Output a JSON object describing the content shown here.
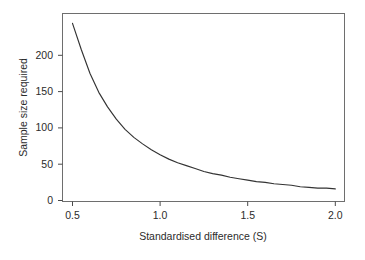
{
  "chart_data": {
    "type": "line",
    "title": "",
    "subtitle": "",
    "xlabel": "Standardised difference (S)",
    "ylabel": "Sample size required",
    "xlim": [
      0.43,
      2.07
    ],
    "ylim": [
      0,
      250
    ],
    "xticks": [
      0.5,
      1.0,
      1.5,
      2.0
    ],
    "xtick_labels": [
      "0.5",
      "1.0",
      "1.5",
      "2.0"
    ],
    "yticks": [
      0,
      50,
      100,
      150,
      200
    ],
    "ytick_labels": [
      "0",
      "50",
      "100",
      "150",
      "200"
    ],
    "grid": false,
    "legend": false,
    "legend_position": "none",
    "series": [
      {
        "name": "Sample size required",
        "relation": "n = 63 / S^2",
        "x": [
          0.5,
          0.55,
          0.6,
          0.65,
          0.7,
          0.75,
          0.8,
          0.85,
          0.9,
          0.95,
          1.0,
          1.05,
          1.1,
          1.15,
          1.2,
          1.25,
          1.3,
          1.35,
          1.4,
          1.45,
          1.5,
          1.55,
          1.6,
          1.65,
          1.7,
          1.75,
          1.8,
          1.85,
          1.9,
          1.95,
          2.0
        ],
        "values": [
          244,
          208,
          175,
          149,
          129,
          112,
          98,
          87,
          78,
          70,
          63,
          57,
          52,
          48,
          44,
          40,
          37,
          35,
          32,
          30,
          28,
          26,
          25,
          23,
          22,
          21,
          19,
          18,
          17,
          17,
          16
        ]
      }
    ],
    "annotations": []
  },
  "axes": {
    "y_axis_title": "Sample size required",
    "x_axis_title": "Standardised difference (S)"
  }
}
